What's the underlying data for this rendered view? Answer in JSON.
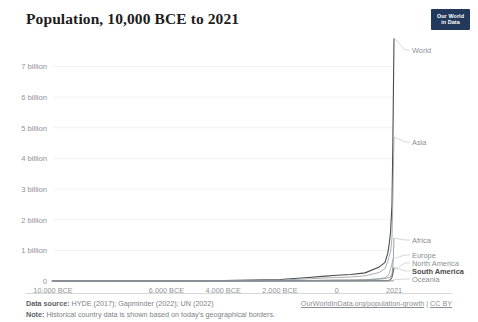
{
  "header": {
    "title": "Population, 10,000 BCE to 2021",
    "logo_line1": "Our World",
    "logo_line2": "in Data",
    "logo_color": "#23395c"
  },
  "footer": {
    "source_key": "Data source:",
    "source_value": "HYDE (2017); Gapminder (2022); UN (2022)",
    "note_key": "Note:",
    "note_value": "Historical country data is shown based on today's geographical borders.",
    "link": "OurWorldInData.org/population-growth",
    "separator": "|",
    "license": "CC BY"
  },
  "chart_data": {
    "type": "line",
    "title": "Population, 10,000 BCE to 2021",
    "xlabel": "",
    "ylabel": "",
    "xlim": [
      -10000,
      2021
    ],
    "ylim": [
      0,
      7600000000
    ],
    "grid": true,
    "legend_position": "right-inline",
    "y_ticks": [
      {
        "value": 0,
        "label": "0"
      },
      {
        "value": 1000000000,
        "label": "1 billion"
      },
      {
        "value": 2000000000,
        "label": "2 billion"
      },
      {
        "value": 3000000000,
        "label": "3 billion"
      },
      {
        "value": 4000000000,
        "label": "4 billion"
      },
      {
        "value": 5000000000,
        "label": "5 billion"
      },
      {
        "value": 6000000000,
        "label": "6 billion"
      },
      {
        "value": 7000000000,
        "label": "7 billion"
      }
    ],
    "x_ticks": [
      {
        "value": -10000,
        "label": "10,000 BCE"
      },
      {
        "value": -6000,
        "label": "6,000 BCE"
      },
      {
        "value": -4000,
        "label": "4,000 BCE"
      },
      {
        "value": -2000,
        "label": "2,000 BCE"
      },
      {
        "value": 0,
        "label": "0"
      },
      {
        "value": 2021,
        "label": "2021"
      }
    ],
    "x": [
      -10000,
      -8000,
      -6000,
      -5000,
      -4000,
      -3000,
      -2000,
      -1000,
      -500,
      0,
      500,
      1000,
      1500,
      1700,
      1800,
      1850,
      1900,
      1950,
      1980,
      2000,
      2021
    ],
    "series": [
      {
        "name": "World",
        "color": "#4a4a4a",
        "label_emphasis": "normal",
        "values": [
          4000000,
          5000000,
          7000000,
          10000000,
          15000000,
          30000000,
          50000000,
          115000000,
          150000000,
          190000000,
          210000000,
          265000000,
          460000000,
          600000000,
          900000000,
          1200000000,
          1600000000,
          2500000000,
          4450000000,
          6150000000,
          7900000000
        ]
      },
      {
        "name": "Asia",
        "color": "#9aa0a6",
        "label_emphasis": "normal",
        "values": [
          2000000,
          2500000,
          3500000,
          5000000,
          8000000,
          18000000,
          30000000,
          70000000,
          95000000,
          115000000,
          130000000,
          170000000,
          280000000,
          400000000,
          630000000,
          800000000,
          950000000,
          1400000000,
          2630000000,
          3730000000,
          4690000000
        ]
      },
      {
        "name": "Africa",
        "color": "#8a9096",
        "label_emphasis": "normal",
        "values": [
          1000000,
          1200000,
          1500000,
          2000000,
          3000000,
          5000000,
          8000000,
          15000000,
          22000000,
          27000000,
          30000000,
          40000000,
          60000000,
          80000000,
          100000000,
          110000000,
          140000000,
          230000000,
          480000000,
          810000000,
          1390000000
        ]
      },
      {
        "name": "Europe",
        "color": "#9aa0a6",
        "label_emphasis": "normal",
        "values": [
          500000,
          700000,
          1000000,
          1500000,
          2000000,
          4000000,
          7000000,
          15000000,
          20000000,
          31000000,
          30000000,
          40000000,
          78000000,
          105000000,
          160000000,
          240000000,
          400000000,
          550000000,
          690000000,
          727000000,
          745000000
        ]
      },
      {
        "name": "North America",
        "color": "#9aa0a6",
        "label_emphasis": "normal",
        "values": [
          300000,
          350000,
          400000,
          500000,
          700000,
          1000000,
          1500000,
          2000000,
          2500000,
          3000000,
          3500000,
          4000000,
          5000000,
          4000000,
          7000000,
          26000000,
          82000000,
          172000000,
          254000000,
          312000000,
          371000000
        ]
      },
      {
        "name": "South America",
        "color": "#4a4a4a",
        "label_emphasis": "bold",
        "values": [
          200000,
          250000,
          300000,
          400000,
          600000,
          900000,
          1500000,
          2500000,
          3500000,
          5000000,
          6000000,
          8000000,
          12000000,
          9000000,
          12000000,
          22000000,
          38000000,
          114000000,
          241000000,
          349000000,
          434000000
        ]
      },
      {
        "name": "Oceania",
        "color": "#a8aeb4",
        "label_emphasis": "normal",
        "values": [
          100000,
          120000,
          150000,
          180000,
          220000,
          280000,
          350000,
          450000,
          550000,
          700000,
          800000,
          1000000,
          1300000,
          1500000,
          2000000,
          2000000,
          6000000,
          13000000,
          23000000,
          31000000,
          45000000
        ]
      }
    ],
    "series_label_positions": [
      {
        "name": "World",
        "y_px": 50
      },
      {
        "name": "Asia",
        "y_px": 142
      },
      {
        "name": "Africa",
        "y_px": 240
      },
      {
        "name": "Europe",
        "y_px": 255
      },
      {
        "name": "North America",
        "y_px": 263
      },
      {
        "name": "South America",
        "y_px": 271
      },
      {
        "name": "Oceania",
        "y_px": 279
      }
    ]
  }
}
